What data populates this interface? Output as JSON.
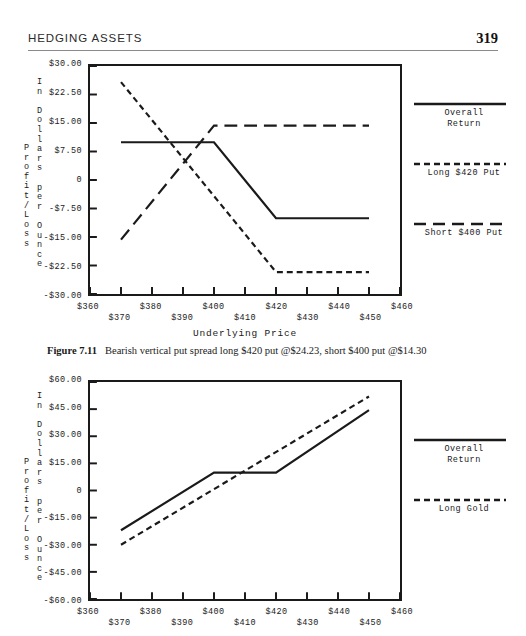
{
  "header": {
    "title": "HEDGING ASSETS",
    "folio": "319"
  },
  "axis_titles": {
    "y_outer": "Profit/Loss",
    "y_inner": "In Dollars per Ounce",
    "x": "Underlying Price"
  },
  "figure1": {
    "caption_number": "Figure 7.11",
    "caption_text": "Bearish vertical put spread long $420 put @$24.23, short $400 put @$14.30",
    "legend": [
      {
        "label": "Overall\nReturn",
        "style": "solid"
      },
      {
        "label": "Long $420 Put",
        "style": "dash-small"
      },
      {
        "label": "Short $400 Put",
        "style": "dash-large"
      }
    ]
  },
  "figure2": {
    "legend": [
      {
        "label": "Overall\nReturn",
        "style": "solid"
      },
      {
        "label": "Long Gold",
        "style": "dash-small"
      }
    ]
  },
  "chart_data": [
    {
      "type": "line",
      "id": "figure-7-11",
      "title": "Bearish vertical put spread long $420 put @$24.23, short $400 put @$14.30",
      "xlabel": "Underlying Price",
      "ylabel": "Profit/Loss In Dollars per Ounce",
      "xlim": [
        360,
        460
      ],
      "ylim": [
        -30,
        30
      ],
      "xticks": [
        360,
        370,
        380,
        390,
        400,
        410,
        420,
        430,
        440,
        450,
        460
      ],
      "xticklabels": [
        "$360",
        "$370",
        "$380",
        "$390",
        "$400",
        "$410",
        "$420",
        "$430",
        "$440",
        "$450",
        "$460"
      ],
      "yticks": [
        -30,
        -22.5,
        -15,
        -7.5,
        0,
        7.5,
        15,
        22.5,
        30
      ],
      "yticklabels": [
        "-$30.00",
        "-$22.50",
        "-$15.00",
        "-$7.50",
        "0",
        "$7.50",
        "$15.00",
        "$22.50",
        "$30.00"
      ],
      "grid": false,
      "legend_position": "right",
      "series": [
        {
          "name": "Overall Return",
          "style": "solid",
          "x": [
            370,
            400,
            420,
            450
          ],
          "y": [
            9.93,
            9.93,
            -10.07,
            -10.07
          ]
        },
        {
          "name": "Long $420 Put",
          "style": "dashed-small",
          "x": [
            370,
            420,
            450
          ],
          "y": [
            25.77,
            -24.23,
            -24.23
          ]
        },
        {
          "name": "Short $400 Put",
          "style": "dashed-large",
          "x": [
            370,
            400,
            450
          ],
          "y": [
            -15.7,
            14.3,
            14.3
          ]
        }
      ]
    },
    {
      "type": "line",
      "id": "figure-lower",
      "title": "",
      "xlabel": "Underlying Price",
      "ylabel": "Profit/Loss In Dollars per Ounce",
      "xlim": [
        360,
        460
      ],
      "ylim": [
        -60,
        60
      ],
      "xticks": [
        360,
        370,
        380,
        390,
        400,
        410,
        420,
        430,
        440,
        450,
        460
      ],
      "xticklabels": [
        "$360",
        "$370",
        "$380",
        "$390",
        "$400",
        "$410",
        "$420",
        "$430",
        "$440",
        "$450",
        "$460"
      ],
      "yticks": [
        -60,
        -45,
        -30,
        -15,
        0,
        15,
        30,
        45,
        60
      ],
      "yticklabels": [
        "-$60.00",
        "-$45.00",
        "-$30.00",
        "-$15.00",
        "0",
        "$15.00",
        "$30.00",
        "$45.00",
        "$60.00"
      ],
      "grid": false,
      "legend_position": "right",
      "series": [
        {
          "name": "Overall Return",
          "style": "solid",
          "x": [
            370,
            400,
            420,
            450
          ],
          "y": [
            -22.0,
            9.9,
            9.9,
            44.5
          ]
        },
        {
          "name": "Long Gold",
          "style": "dashed-small",
          "x": [
            370,
            450
          ],
          "y": [
            -30.0,
            52.0
          ]
        }
      ]
    }
  ]
}
